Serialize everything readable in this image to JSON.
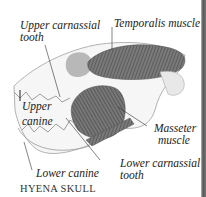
{
  "diagram": {
    "title": "HYENA SKULL",
    "labels": {
      "upper_carnassial": [
        "Upper carnassial",
        "tooth"
      ],
      "temporalis": "Temporalis muscle",
      "upper_canine": [
        "Upper",
        "canine"
      ],
      "masseter": [
        "Masseter",
        "muscle"
      ],
      "lower_carnassial": [
        "Lower carnassial",
        "tooth"
      ],
      "lower_canine": "Lower canine"
    },
    "colors": {
      "muscle": "#6a6a6a",
      "bone_outline": "#9a9a9a",
      "text": "#222222"
    }
  }
}
